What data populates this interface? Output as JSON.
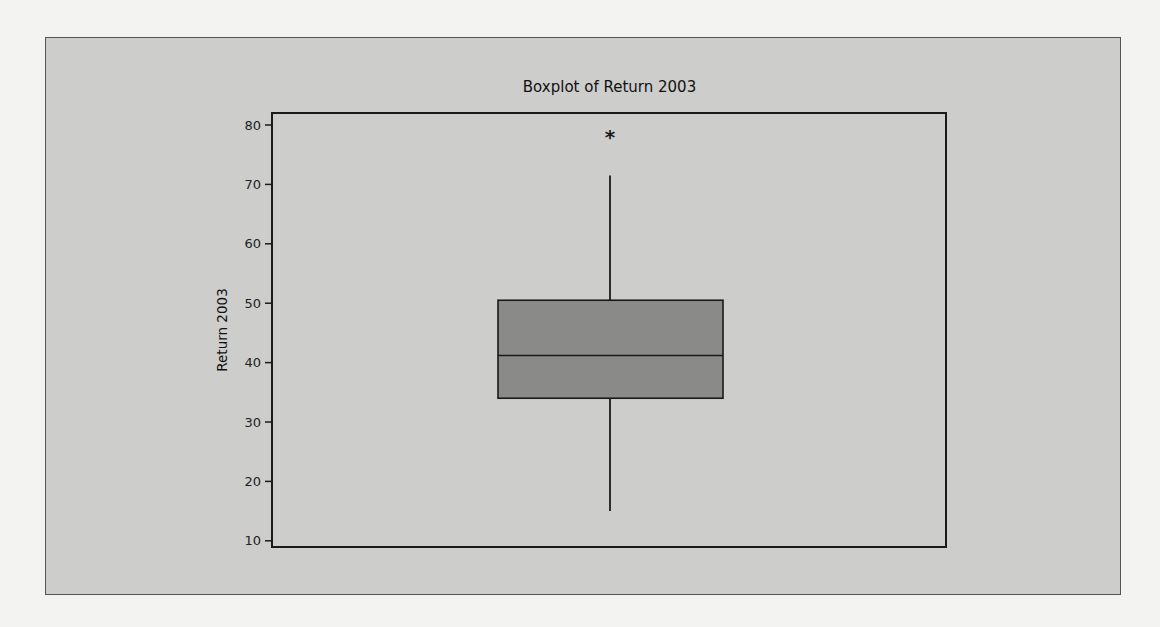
{
  "chart_data": {
    "type": "boxplot",
    "title": "Boxplot of Return 2003",
    "xlabel": "",
    "ylabel": "Return 2003",
    "ylim": [
      9,
      82
    ],
    "yticks": [
      10,
      20,
      30,
      40,
      50,
      60,
      70,
      80
    ],
    "ytick_labels": [
      "10",
      "20",
      "30",
      "40",
      "50",
      "60",
      "70",
      "80"
    ],
    "grid": false,
    "legend": null,
    "series": [
      {
        "name": "Return 2003",
        "whisker_low": 15.0,
        "q1": 34.0,
        "median": 41.2,
        "q3": 50.5,
        "whisker_high": 71.5,
        "outliers": [
          78.3
        ]
      }
    ],
    "outlier_marker": "*",
    "colors": {
      "box_fill": "#8a8a88",
      "panel_bg": "#cdcdcb",
      "page_bg": "#f3f3f1",
      "lines": "#1a1a1a"
    }
  }
}
